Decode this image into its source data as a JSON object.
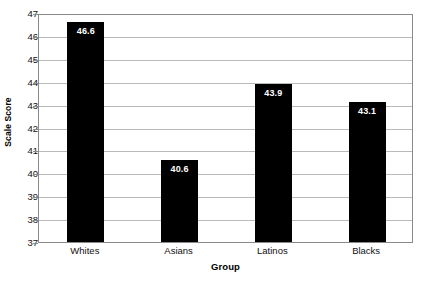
{
  "chart_data": {
    "type": "bar",
    "title": "",
    "categories": [
      "Whites",
      "Asians",
      "Latinos",
      "Blacks"
    ],
    "values": [
      46.6,
      40.6,
      43.9,
      43.1
    ],
    "value_labels": [
      "46.6",
      "40.6",
      "43.9",
      "43.1"
    ],
    "xlabel": "Group",
    "ylabel": "Scale Score",
    "ylim": [
      37,
      47
    ],
    "ytick_labels": [
      "47",
      "46",
      "45",
      "44",
      "43",
      "42",
      "41",
      "40",
      "39",
      "38",
      "37"
    ],
    "ytick_values": [
      47,
      46,
      45,
      44,
      43,
      42,
      41,
      40,
      39,
      38,
      37
    ],
    "grid": true,
    "legend": null,
    "bar_color": "#000000",
    "value_label_color": "#ffffff",
    "gridline_color": "#b9b9b9",
    "frame_color": "#8a8a8a",
    "background_color": "#ffffff"
  }
}
